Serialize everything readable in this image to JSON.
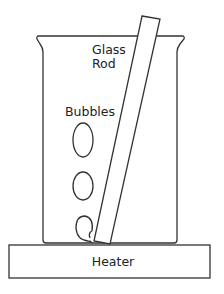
{
  "diagram": {
    "labels": {
      "glass_rod_line1": "Glass",
      "glass_rod_line2": "Rod",
      "bubbles": "Bubbles",
      "heater": "Heater"
    },
    "components": [
      "beaker",
      "glass-rod",
      "bubbles",
      "heater"
    ],
    "bubble_count": 3,
    "colors": {
      "stroke": "#333333",
      "fill": "#ffffff",
      "text": "#222222"
    }
  }
}
